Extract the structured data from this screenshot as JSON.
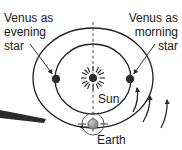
{
  "figure": {
    "background_color": "#ffffff",
    "ink_color": "#1f1f1f"
  },
  "labels": {
    "evening_star": {
      "line1": "Venus as",
      "line2": "evening",
      "line3": "star"
    },
    "morning_star": {
      "line1": "Venus as",
      "line2": "morning",
      "line3": "star"
    },
    "sun": "Sun",
    "earth": "Earth"
  },
  "bodies": {
    "sun": {
      "name": "Sun",
      "cx": 93,
      "cy": 78,
      "radius": 4,
      "color": "#2b2b2b",
      "ray_count": 12
    },
    "venus_evening": {
      "name": "Venus",
      "cx": 56,
      "cy": 79,
      "radius": 4.2,
      "color": "#2b2b2b"
    },
    "venus_morning": {
      "name": "Venus",
      "cx": 130,
      "cy": 79,
      "radius": 4.2,
      "color": "#2b2b2b"
    },
    "earth": {
      "name": "Earth",
      "cx": 93,
      "cy": 124,
      "radius": 5,
      "color": "#8c8c8c"
    }
  },
  "orbits": {
    "earth_orbit": {
      "cx": 93,
      "cy": 78,
      "rx": 60,
      "ry": 50,
      "stroke": "#1f1f1f"
    },
    "venus_orbit": {
      "cx": 93,
      "cy": 79,
      "rx": 38,
      "ry": 35,
      "stroke": "#1f1f1f"
    },
    "earth_rotation_ring": {
      "cx": 93,
      "cy": 124,
      "r": 11,
      "stroke": "#5a5a5a"
    }
  },
  "axis": {
    "name": "vertical-dashed-axis",
    "x": 93,
    "y_top": 22,
    "y_bottom": 132,
    "style": "dashed",
    "color": "#4a4a4a"
  },
  "motion_arrows": {
    "orbit_direction": "counterclockwise",
    "arcs": [
      {
        "name": "venus-orbit-direction-arc"
      },
      {
        "name": "earth-orbit-direction-arc"
      },
      {
        "name": "outer-direction-arc"
      }
    ],
    "earth_spin_arrow": "left"
  },
  "leaders": [
    {
      "name": "evening-star-leader",
      "from_x": 30,
      "from_y": 44,
      "to_x": 53,
      "to_y": 74
    },
    {
      "name": "morning-star-leader",
      "from_x": 154,
      "from_y": 44,
      "to_x": 133,
      "to_y": 74
    }
  ]
}
